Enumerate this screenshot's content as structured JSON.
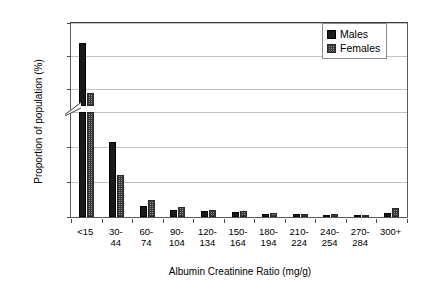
{
  "chart_data": {
    "type": "bar",
    "title": "",
    "xlabel": "Albumin Creatinine Ratio (mg/g)",
    "ylabel": "Proportion of population (%)",
    "categories": [
      "<15",
      "30-\n44",
      "60-\n74",
      "90-\n104",
      "120-\n134",
      "150-\n164",
      "180-\n194",
      "210-\n224",
      "240-\n254",
      "270-\n284",
      "300+"
    ],
    "series": [
      {
        "name": "Males",
        "values": [
          87.0,
          10.7,
          1.6,
          1.0,
          0.8,
          0.7,
          0.5,
          0.4,
          0.35,
          0.3,
          0.6
        ]
      },
      {
        "name": "Females",
        "values": [
          79.5,
          6.0,
          2.5,
          1.5,
          1.0,
          0.8,
          0.6,
          0.5,
          0.4,
          0.35,
          1.3
        ]
      }
    ],
    "yticks": [
      0,
      5,
      10,
      15,
      80,
      85,
      90
    ],
    "ylim_lower": [
      0,
      15
    ],
    "ylim_upper": [
      77.5,
      90
    ],
    "axis_break": true,
    "grid": true,
    "legend_position": "top-right",
    "colors": {
      "males": "#1a1a1a",
      "females": "#8d8d8d",
      "grid": "#c3c3c3",
      "frame": "#5a5a5a"
    }
  },
  "legend": {
    "items": [
      {
        "label": "Males"
      },
      {
        "label": "Females"
      }
    ]
  }
}
